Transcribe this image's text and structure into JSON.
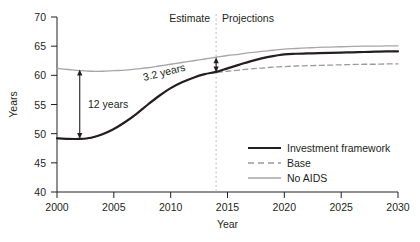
{
  "chart_data": {
    "type": "line",
    "title": "",
    "xlabel": "Year",
    "ylabel": "Years",
    "xlim": [
      2000,
      2030
    ],
    "ylim": [
      40,
      70
    ],
    "xticks": [
      "2000",
      "2005",
      "2010",
      "2015",
      "2020",
      "2025",
      "2030"
    ],
    "yticks": [
      "40",
      "45",
      "50",
      "55",
      "60",
      "65",
      "70"
    ],
    "grid": false,
    "legend_position": "lower right",
    "x": [
      2000,
      2001,
      2002,
      2003,
      2004,
      2005,
      2006,
      2007,
      2008,
      2009,
      2010,
      2011,
      2012,
      2013,
      2014,
      2015,
      2016,
      2017,
      2018,
      2019,
      2020,
      2021,
      2022,
      2023,
      2024,
      2025,
      2026,
      2027,
      2028,
      2029,
      2030
    ],
    "series": [
      {
        "name": "Investment framework",
        "style": "solid",
        "color": "#231f20",
        "width": 2.2,
        "values": [
          49.2,
          49.1,
          49.1,
          49.3,
          49.9,
          50.8,
          52.0,
          53.4,
          55.0,
          56.5,
          57.8,
          58.8,
          59.6,
          60.2,
          60.6,
          61.2,
          61.8,
          62.4,
          62.9,
          63.3,
          63.6,
          63.7,
          63.75,
          63.8,
          63.85,
          63.9,
          63.95,
          64.0,
          64.05,
          64.1,
          64.1
        ]
      },
      {
        "name": "Base",
        "style": "dashed",
        "color": "#9b9b9b",
        "width": 1.3,
        "values": [
          49.2,
          49.1,
          49.1,
          49.3,
          49.9,
          50.8,
          52.0,
          53.4,
          55.0,
          56.5,
          57.8,
          58.8,
          59.6,
          60.2,
          60.5,
          60.7,
          60.9,
          61.1,
          61.25,
          61.4,
          61.5,
          61.6,
          61.65,
          61.7,
          61.75,
          61.8,
          61.85,
          61.9,
          61.9,
          61.95,
          61.95
        ]
      },
      {
        "name": "No AIDS",
        "style": "solid",
        "color": "#a6a6a6",
        "width": 1.3,
        "values": [
          61.2,
          61.0,
          60.8,
          60.7,
          60.7,
          60.8,
          60.9,
          61.1,
          61.3,
          61.6,
          61.9,
          62.2,
          62.5,
          62.8,
          63.1,
          63.4,
          63.6,
          63.9,
          64.1,
          64.3,
          64.5,
          64.6,
          64.7,
          64.8,
          64.85,
          64.9,
          64.95,
          65.0,
          65.0,
          65.05,
          65.05
        ]
      }
    ],
    "annotations": [
      {
        "name": "gap-2002",
        "label": "12 years",
        "x": 2002,
        "y_from": 49.1,
        "y_to": 61.0,
        "arrow": "double"
      },
      {
        "name": "gap-2014",
        "label": "3.2 years",
        "x": 2014,
        "y_from": 60.5,
        "y_to": 63.1,
        "arrow": "double",
        "label_rotation": -14
      }
    ],
    "divider": {
      "name": "estimate-projection-divider",
      "x": 2014,
      "style": "dashed",
      "left_label": "Estimate",
      "right_label": "Projections"
    }
  }
}
